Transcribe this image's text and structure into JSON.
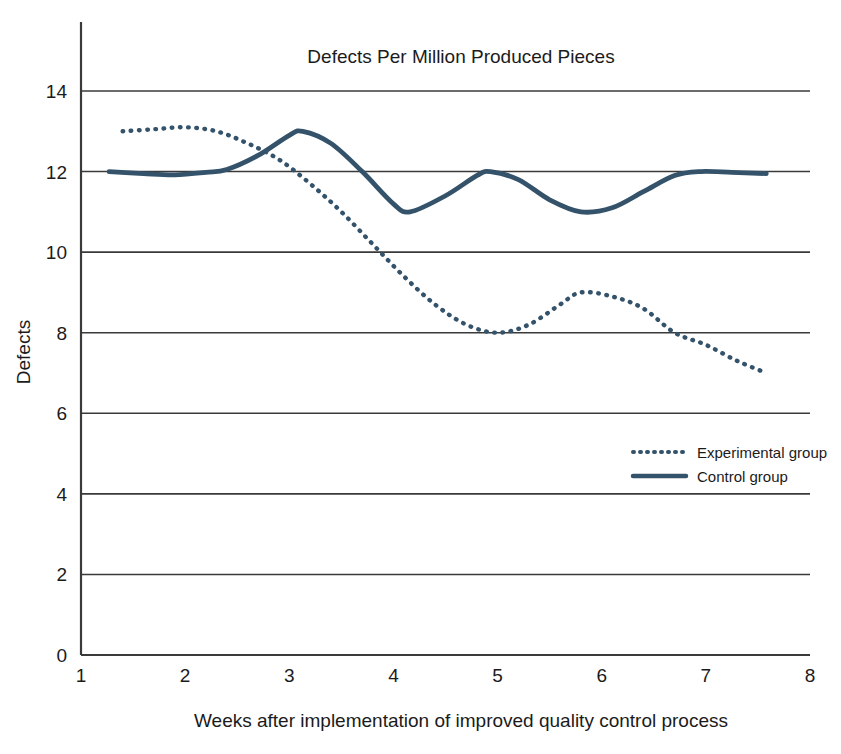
{
  "chart_data": {
    "type": "line",
    "title": "Defects Per Million Produced Pieces",
    "xlabel": "Weeks after implementation of improved quality control process",
    "ylabel": "Defects",
    "xlim": [
      1,
      8
    ],
    "ylim": [
      0,
      14
    ],
    "xticks": [
      "1",
      "2",
      "3",
      "4",
      "5",
      "6",
      "7",
      "8"
    ],
    "yticks": [
      "0",
      "2",
      "4",
      "6",
      "8",
      "10",
      "12",
      "14"
    ],
    "grid": "horizontal",
    "legend_position": "middle-right",
    "series": [
      {
        "name": "Experimental group",
        "style": "dotted",
        "color": "#34536b",
        "x": [
          1.4,
          1.7,
          2.0,
          2.3,
          2.6,
          2.9,
          3.2,
          3.5,
          3.8,
          4.1,
          4.4,
          4.7,
          5.0,
          5.3,
          5.6,
          5.8,
          6.1,
          6.4,
          6.7,
          7.0,
          7.3,
          7.58
        ],
        "y": [
          13.0,
          13.05,
          13.1,
          13.0,
          12.7,
          12.3,
          11.7,
          11.0,
          10.2,
          9.4,
          8.7,
          8.2,
          8.0,
          8.2,
          8.7,
          9.0,
          8.9,
          8.6,
          8.0,
          7.7,
          7.3,
          7.0
        ]
      },
      {
        "name": "Control group",
        "style": "solid",
        "color": "#34536b",
        "x": [
          1.27,
          1.6,
          1.9,
          2.2,
          2.4,
          2.7,
          3.0,
          3.13,
          3.4,
          3.7,
          4.0,
          4.16,
          4.5,
          4.8,
          4.93,
          5.2,
          5.5,
          5.8,
          6.1,
          6.4,
          6.7,
          6.95,
          7.25,
          7.58
        ],
        "y": [
          12.0,
          11.95,
          11.92,
          11.98,
          12.05,
          12.4,
          12.9,
          13.0,
          12.7,
          12.0,
          11.2,
          11.0,
          11.4,
          11.9,
          12.0,
          11.8,
          11.3,
          11.0,
          11.1,
          11.5,
          11.9,
          12.0,
          11.98,
          11.95
        ]
      }
    ]
  },
  "legend": {
    "items": [
      {
        "label": "Experimental group",
        "style": "dotted"
      },
      {
        "label": "Control group",
        "style": "solid"
      }
    ]
  }
}
